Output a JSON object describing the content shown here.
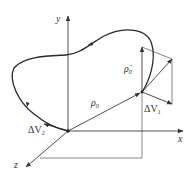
{
  "diagram": {
    "axes": {
      "x": "x",
      "y": "y",
      "z": "z"
    },
    "labels": {
      "position_vector": {
        "symbol": "ρ",
        "subscript": "0"
      },
      "velocity_vector": {
        "symbol": "ρ̇",
        "subscript": "0"
      },
      "delta_v1": {
        "prefix": "ΔV",
        "subscript": "1"
      },
      "delta_v2": {
        "prefix": "ΔV",
        "subscript": "2"
      }
    },
    "colors": {
      "ink": "#2a2a2a",
      "background": "#ffffff"
    }
  }
}
